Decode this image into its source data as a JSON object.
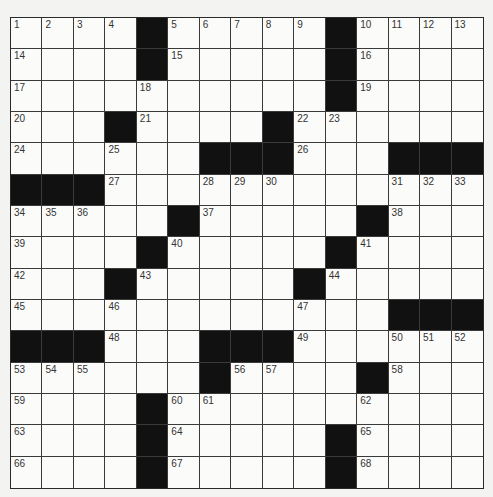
{
  "puzzle": {
    "rows": 15,
    "cols": 15,
    "colors": {
      "background": "#f3f3f1",
      "cell": "#fbfbfa",
      "block": "#111111",
      "line": "#3a3a3a",
      "number": "#333333"
    },
    "grid": [
      [
        "1",
        "2",
        "3",
        "4",
        "#",
        "5",
        "6",
        "7",
        "8",
        "9",
        "#",
        "10",
        "11",
        "12",
        "13"
      ],
      [
        "14",
        "",
        "",
        "",
        "#",
        "15",
        "",
        "",
        "",
        "",
        "#",
        "16",
        "",
        "",
        ""
      ],
      [
        "17",
        "",
        "",
        "",
        "18",
        "",
        "",
        "",
        "",
        "",
        "#",
        "19",
        "",
        "",
        ""
      ],
      [
        "20",
        "",
        "",
        "#",
        "21",
        "",
        "",
        "",
        "#",
        "22",
        "23",
        "",
        "",
        "",
        ""
      ],
      [
        "24",
        "",
        "",
        "25",
        "",
        "",
        "#",
        "#",
        "#",
        "26",
        "",
        "",
        "#",
        "#",
        "#"
      ],
      [
        "#",
        "#",
        "#",
        "27",
        "",
        "",
        "28",
        "29",
        "30",
        "",
        "",
        "",
        "31",
        "32",
        "33"
      ],
      [
        "34",
        "35",
        "36",
        "",
        "",
        "#",
        "37",
        "",
        "",
        "",
        "",
        "#",
        "38",
        "",
        ""
      ],
      [
        "39",
        "",
        "",
        "",
        "#",
        "40",
        "",
        "",
        "",
        "",
        "#",
        "41",
        "",
        "",
        ""
      ],
      [
        "42",
        "",
        "",
        "#",
        "43",
        "",
        "",
        "",
        "",
        "#",
        "44",
        "",
        "",
        "",
        ""
      ],
      [
        "45",
        "",
        "",
        "46",
        "",
        "",
        "",
        "",
        "",
        "47",
        "",
        "",
        "#",
        "#",
        "#"
      ],
      [
        "#",
        "#",
        "#",
        "48",
        "",
        "",
        "#",
        "#",
        "#",
        "49",
        "",
        "",
        "50",
        "51",
        "52"
      ],
      [
        "53",
        "54",
        "55",
        "",
        "",
        "",
        "#",
        "56",
        "57",
        "",
        "",
        "#",
        "58",
        "",
        ""
      ],
      [
        "59",
        "",
        "",
        "",
        "#",
        "60",
        "61",
        "",
        "",
        "",
        "",
        "62",
        "",
        "",
        ""
      ],
      [
        "63",
        "",
        "",
        "",
        "#",
        "64",
        "",
        "",
        "",
        "",
        "#",
        "65",
        "",
        "",
        ""
      ],
      [
        "66",
        "",
        "",
        "",
        "#",
        "67",
        "",
        "",
        "",
        "",
        "#",
        "68",
        "",
        "",
        ""
      ]
    ]
  }
}
